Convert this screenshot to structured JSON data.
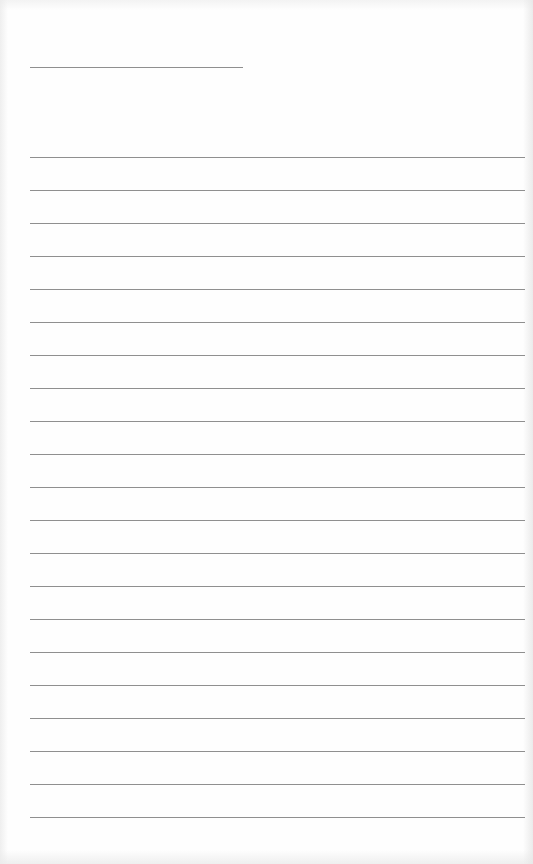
{
  "page": {
    "type": "lined-paper",
    "title_line": {
      "x": 30,
      "y": 67,
      "length": 213
    },
    "writing_lines": {
      "count": 21,
      "first_y": 157,
      "spacing": 33,
      "x": 30,
      "length": 495
    },
    "colors": {
      "paper": "#fefefe",
      "rule": "#8f8f8f"
    }
  }
}
